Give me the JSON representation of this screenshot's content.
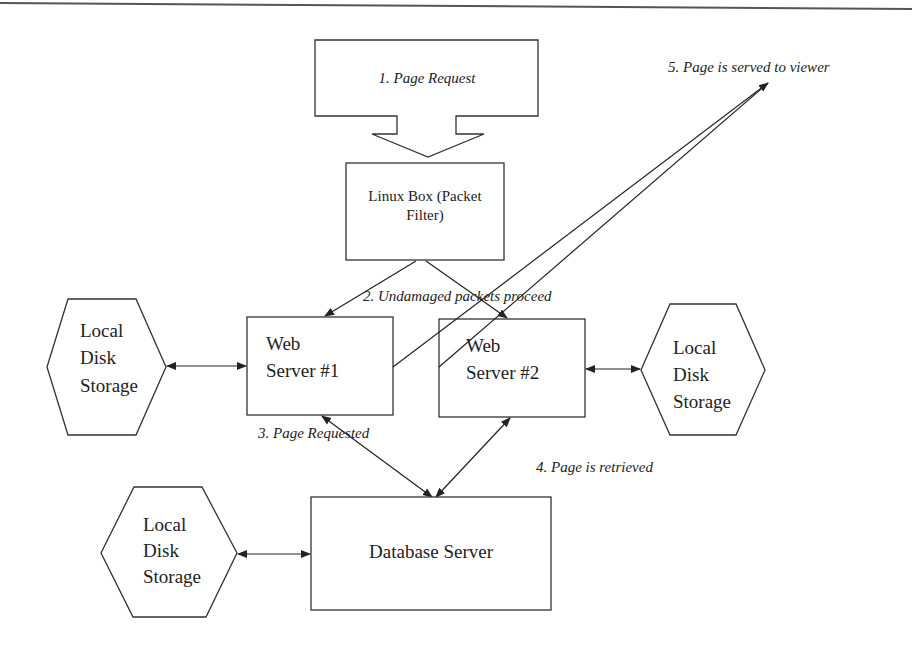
{
  "diagram": {
    "type": "network-architecture-flow",
    "colors": {
      "line": "#222222",
      "background": "#ffffff",
      "text": "#222222"
    },
    "nodes": {
      "page_request": {
        "label": "1.  Page Request",
        "shape": "block-arrow-down"
      },
      "linux_box": {
        "line1": "Linux Box (Packet",
        "line2": "Filter)",
        "shape": "rectangle"
      },
      "web_server_1": {
        "line1": "Web",
        "line2": "Server #1",
        "shape": "rectangle"
      },
      "web_server_2": {
        "line1": "Web",
        "line2": "Server #2",
        "shape": "rectangle"
      },
      "database_server": {
        "label": "Database Server",
        "shape": "rectangle"
      },
      "storage_left": {
        "line1": "Local",
        "line2": "Disk",
        "line3": "Storage",
        "shape": "hexagon"
      },
      "storage_right": {
        "line1": "Local",
        "line2": "Disk",
        "line3": "Storage",
        "shape": "hexagon"
      },
      "storage_db": {
        "line1": "Local",
        "line2": "Disk",
        "line3": "Storage",
        "shape": "hexagon"
      }
    },
    "annotations": {
      "step2": "2. Undamaged packets proceed",
      "step3": "3. Page Requested",
      "step4": "4. Page is retrieved",
      "step5": "5. Page is served to viewer"
    },
    "edges": [
      {
        "from": "page_request",
        "to": "linux_box"
      },
      {
        "from": "linux_box",
        "to": "web_server_1"
      },
      {
        "from": "linux_box",
        "to": "web_server_2"
      },
      {
        "from": "storage_left",
        "to": "web_server_1",
        "bidirectional": true
      },
      {
        "from": "web_server_2",
        "to": "storage_right",
        "bidirectional": true
      },
      {
        "from": "web_server_1",
        "to": "database_server",
        "bidirectional": true
      },
      {
        "from": "web_server_2",
        "to": "database_server",
        "bidirectional": true
      },
      {
        "from": "storage_db",
        "to": "database_server",
        "bidirectional": true
      },
      {
        "from": "web_server_1",
        "to": "viewer"
      },
      {
        "from": "web_server_2",
        "to": "viewer"
      }
    ]
  }
}
